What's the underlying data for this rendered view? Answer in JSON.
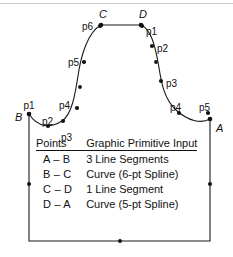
{
  "figure": {
    "stroke_color": "#1a1a1a",
    "point_color": "#111111",
    "background": "#ffffff",
    "vertices": [
      {
        "id": "A",
        "label": "A",
        "x": 210,
        "y": 119
      },
      {
        "id": "B",
        "label": "B",
        "x": 29,
        "y": 114
      },
      {
        "id": "C",
        "label": "C",
        "x": 101,
        "y": 25
      },
      {
        "id": "D",
        "label": "D",
        "x": 141,
        "y": 25
      }
    ],
    "segments": [
      {
        "name": "A-B",
        "type": "3 Line Segments",
        "path": "M 210 119 L 210 241 L 29 241 L 29 114"
      },
      {
        "name": "B-C",
        "type": "Curve (6-pt Spline)",
        "path": "M 29 114 C 38 128 51 128 62 121 C 72 114 75 95 78 76 C 81 55 88 32 101 25"
      },
      {
        "name": "C-D",
        "type": "1 Line Segment",
        "path": "M 101 25 L 141 25"
      },
      {
        "name": "D-A",
        "type": "Curve (5-pt Spline)",
        "path": "M 141 25 C 151 29 155 46 158 62 C 161 80 163 98 176 110 C 188 121 201 124 210 119"
      }
    ],
    "control_points": {
      "A-B": [],
      "B-C": [
        {
          "label": "p1",
          "x": 29,
          "y": 114,
          "lx": 29,
          "ly": 101,
          "anchor": "center"
        },
        {
          "label": "p2",
          "x": 48,
          "y": 126,
          "lx": 42,
          "ly": 117,
          "anchor": "left"
        },
        {
          "label": "p3",
          "x": 63,
          "y": 121,
          "lx": 61,
          "ly": 133,
          "anchor": "left"
        },
        {
          "label": "p4",
          "x": 77,
          "y": 108,
          "lx": 59,
          "ly": 101,
          "anchor": "left"
        },
        {
          "label": "p5",
          "x": 84,
          "y": 62,
          "lx": 68,
          "ly": 58,
          "anchor": "left"
        },
        {
          "label": "p6",
          "x": 100,
          "y": 26,
          "lx": 82,
          "ly": 22,
          "anchor": "left"
        }
      ],
      "D-A": [
        {
          "label": "p1",
          "x": 142,
          "y": 26,
          "lx": 146,
          "ly": 27,
          "anchor": "left"
        },
        {
          "label": "p2",
          "x": 152,
          "y": 46,
          "lx": 157,
          "ly": 44,
          "anchor": "left"
        },
        {
          "label": "p3",
          "x": 161,
          "y": 81,
          "lx": 166,
          "ly": 79,
          "anchor": "left"
        },
        {
          "label": "p4",
          "x": 179,
          "y": 113,
          "lx": 170,
          "ly": 103,
          "anchor": "left"
        },
        {
          "label": "p5",
          "x": 208,
          "y": 113,
          "lx": 199,
          "ly": 103,
          "anchor": "left"
        }
      ]
    },
    "midpoint_markers": [
      {
        "on": "left-vertical",
        "x": 29,
        "y": 184
      },
      {
        "on": "bottom-horizontal",
        "x": 120,
        "y": 241
      },
      {
        "on": "right-vertical",
        "x": 210,
        "y": 184
      }
    ],
    "intermediate_curve_markers": [
      {
        "on": "B-C",
        "x": 80,
        "y": 87
      },
      {
        "on": "D-A",
        "x": 156,
        "y": 62
      }
    ]
  },
  "table": {
    "headers": {
      "points": "Points",
      "primitive": "Graphic Primitive Input"
    },
    "rows": [
      {
        "points": "A – B",
        "primitive": "3 Line Segments"
      },
      {
        "points": "B – C",
        "primitive": "Curve (6-pt Spline)"
      },
      {
        "points": "C – D",
        "primitive": "1 Line Segment"
      },
      {
        "points": "D – A",
        "primitive": "Curve (5-pt Spline)"
      }
    ]
  }
}
